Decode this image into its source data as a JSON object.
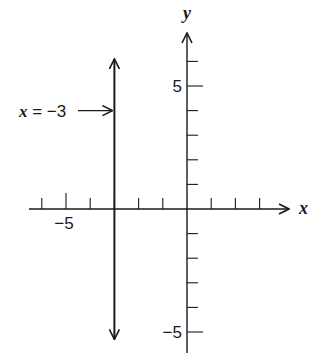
{
  "chart_data": {
    "type": "line",
    "title": "",
    "xlabel": "x",
    "ylabel": "y",
    "xlim": [
      -6.5,
      4.5
    ],
    "ylim": [
      -6,
      7
    ],
    "grid": false,
    "x_ticks": [
      -6,
      -5,
      -4,
      -3,
      -2,
      -1,
      1,
      2,
      3
    ],
    "y_ticks": [
      6,
      5,
      4,
      3,
      2,
      1,
      -1,
      -2,
      -3,
      -4,
      -5
    ],
    "x_tick_labels": [
      {
        "value": -5,
        "label": "−5"
      }
    ],
    "y_tick_labels": [
      {
        "value": 5,
        "label": "5"
      },
      {
        "value": -5,
        "label": "−5"
      }
    ],
    "series": [
      {
        "name": "x = −3",
        "kind": "vertical-line",
        "x": -3,
        "y_range": [
          -5.3,
          6.1
        ],
        "arrows": "both"
      }
    ],
    "annotations": [
      {
        "text_var": "x",
        "text_rest": " = −3",
        "points_to": {
          "x": -3,
          "y": 4
        },
        "arrow": true
      }
    ]
  }
}
